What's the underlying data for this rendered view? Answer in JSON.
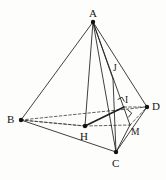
{
  "figure": {
    "type": "geometry-diagram",
    "canvas": {
      "width": 166,
      "height": 180,
      "background": "#fdfdfc"
    },
    "stroke_color": "#1d1d1d",
    "dash_color": "#3a3a3a",
    "vertex_dot_color": "#111111",
    "points": [
      {
        "id": "A",
        "label": "A",
        "x": 93,
        "y": 22,
        "dot": true,
        "label_x": 89,
        "label_y": 8,
        "size": "normal"
      },
      {
        "id": "B",
        "label": "B",
        "x": 21,
        "y": 120,
        "dot": true,
        "label_x": 7,
        "label_y": 114,
        "size": "normal"
      },
      {
        "id": "C",
        "label": "C",
        "x": 116,
        "y": 152,
        "dot": true,
        "label_x": 112,
        "label_y": 158,
        "size": "normal"
      },
      {
        "id": "D",
        "label": "D",
        "x": 147,
        "y": 107,
        "dot": true,
        "label_x": 152,
        "label_y": 101,
        "size": "normal"
      },
      {
        "id": "H",
        "label": "H",
        "x": 85,
        "y": 126,
        "dot": true,
        "label_x": 80,
        "label_y": 131,
        "size": "normal"
      },
      {
        "id": "I",
        "label": "I",
        "x": 124,
        "y": 107,
        "dot": false,
        "label_x": 125,
        "label_y": 96,
        "size": "small"
      },
      {
        "id": "J",
        "label": "J",
        "x": 113,
        "y": 79,
        "dot": false,
        "label_x": 113,
        "label_y": 64,
        "size": "small"
      },
      {
        "id": "M",
        "label": "M",
        "x": 130,
        "y": 125,
        "dot": false,
        "label_x": 131,
        "label_y": 128,
        "size": "small"
      }
    ],
    "solid_edges": [
      {
        "name": "edge-A-B",
        "from": "A",
        "to": "B"
      },
      {
        "name": "edge-A-C",
        "from": "A",
        "to": "C"
      },
      {
        "name": "edge-A-D",
        "from": "A",
        "to": "D"
      },
      {
        "name": "edge-A-H",
        "from": "A",
        "to": "H"
      },
      {
        "name": "edge-A-M",
        "from": "A",
        "to": "M"
      },
      {
        "name": "edge-A-J",
        "from": "A",
        "to": "J"
      },
      {
        "name": "edge-B-C",
        "from": "B",
        "to": "C"
      },
      {
        "name": "edge-C-D",
        "from": "C",
        "to": "D"
      },
      {
        "name": "edge-C-J",
        "from": "C",
        "to": "J"
      },
      {
        "name": "edge-C-M",
        "from": "C",
        "to": "M"
      },
      {
        "name": "edge-H-I",
        "from": "H",
        "to": "I",
        "emphasis": true
      }
    ],
    "dashed_edges": [
      {
        "name": "edge-B-D-dashed",
        "from": "B",
        "to": "D"
      },
      {
        "name": "edge-B-H-dashed",
        "from": "B",
        "to": "H"
      },
      {
        "name": "edge-H-M-dashed",
        "from": "H",
        "to": "M"
      },
      {
        "name": "edge-M-D-dashed",
        "from": "M",
        "to": "D"
      },
      {
        "name": "edge-I-D-dashed",
        "from": "I",
        "to": "D"
      },
      {
        "name": "edge-H-B2-dashed",
        "from": "H",
        "to": "B"
      }
    ],
    "right_angle_marks": [
      {
        "name": "right-angle-at-I",
        "x": 120,
        "y": 104,
        "size": 5,
        "rotate": -28
      },
      {
        "name": "right-angle-at-M",
        "x": 124,
        "y": 114,
        "size": 5.5,
        "rotate": 38
      }
    ]
  }
}
